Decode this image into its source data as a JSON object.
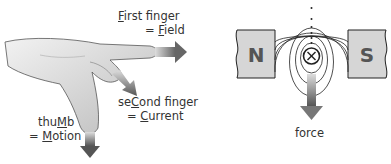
{
  "left_panel": {
    "title": "Fleming's left-hand rule",
    "first_finger": {
      "pre": "",
      "cap": "F",
      "post": "irst finger",
      "eq_pre": "= ",
      "eq_cap": "F",
      "eq_post": "ield"
    },
    "second_finger": {
      "pre": "se",
      "cap": "C",
      "post": "ond finger",
      "eq_pre": "= ",
      "eq_cap": "C",
      "eq_post": "urrent"
    },
    "thumb": {
      "pre": "thu",
      "cap": "M",
      "post": "b",
      "eq_pre": "= ",
      "eq_cap": "M",
      "eq_post": "otion"
    }
  },
  "right_panel": {
    "north_label": "N",
    "south_label": "S",
    "wire_symbol": "⊗",
    "force_label": "force"
  },
  "colors": {
    "magnet_fill": "#d6d6d6",
    "arrow": "#777777",
    "outline": "#222222"
  }
}
